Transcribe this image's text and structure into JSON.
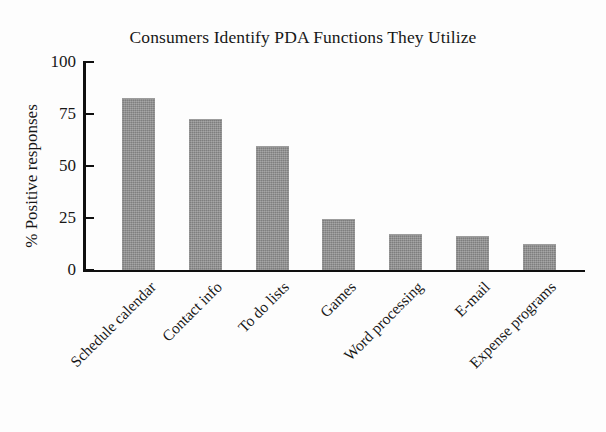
{
  "chart_data": {
    "type": "bar",
    "title": "Consumers Identify PDA Functions They Utilize",
    "xlabel": "",
    "ylabel": "% Positive responses",
    "categories": [
      "Schedule calendar",
      "Contact info",
      "To do lists",
      "Games",
      "Word processing",
      "E-mail",
      "Expense programs"
    ],
    "values": [
      82,
      72,
      59,
      24,
      17,
      16,
      12
    ],
    "ylim": [
      0,
      100
    ],
    "ytick_labels": [
      "100",
      "75",
      "50",
      "25",
      "0"
    ],
    "ytick_values": [
      100,
      75,
      50,
      25,
      0
    ],
    "grid": false,
    "legend": false,
    "bar_color": "#8d8d8d",
    "axis_color": "#0f0f0f",
    "background_color": "#fdfdfd"
  },
  "figure": {
    "title": "Consumers Identify PDA Functions They Utilize",
    "y_axis_title": "% Positive responses"
  }
}
